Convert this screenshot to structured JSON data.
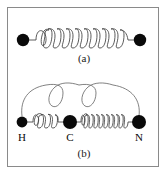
{
  "figure": {
    "background_color": "#ffffff",
    "border_color": "#8a8a8a",
    "node_color": "#0a0a0a",
    "spring_color": "#4a4a4a",
    "arc_color": "#6b6b6b"
  },
  "panels": [
    {
      "id": "a",
      "caption": "(a)",
      "description": "two-mass spring oscillator",
      "nodes": [
        {
          "name": "left-mass",
          "cx": 23,
          "cy": 40,
          "r": 6.2,
          "label": ""
        },
        {
          "name": "right-mass",
          "cx": 140,
          "cy": 40,
          "r": 6.2,
          "label": ""
        }
      ],
      "springs": [
        {
          "name": "spring-a",
          "x1": 33,
          "x2": 131,
          "y": 40,
          "coils": 9,
          "amplitude": 8
        }
      ]
    },
    {
      "id": "b",
      "caption": "(b)",
      "description": "HCN linear molecule with stretch and bend modes",
      "nodes": [
        {
          "name": "atom-h",
          "cx": 22,
          "cy": 122,
          "r": 5.4,
          "label": "H",
          "label_x": 22,
          "label_y": 140
        },
        {
          "name": "atom-c",
          "cx": 70,
          "cy": 122,
          "r": 7.0,
          "label": "C",
          "label_x": 70,
          "label_y": 140
        },
        {
          "name": "atom-n",
          "cx": 139,
          "cy": 122,
          "r": 7.0,
          "label": "N",
          "label_x": 139,
          "label_y": 140
        }
      ],
      "springs": [
        {
          "name": "spring-hc",
          "x1": 31,
          "x2": 62,
          "y": 122,
          "coils": 5,
          "amplitude": 6
        },
        {
          "name": "spring-cn",
          "x1": 80,
          "x2": 131,
          "y": 122,
          "coils": 12,
          "amplitude": 6
        }
      ],
      "bend_spring": {
        "name": "bend-arc",
        "start_x": 22,
        "start_y": 116,
        "end_x": 139,
        "end_y": 116,
        "apex_y": 86,
        "loops": 2
      }
    }
  ]
}
